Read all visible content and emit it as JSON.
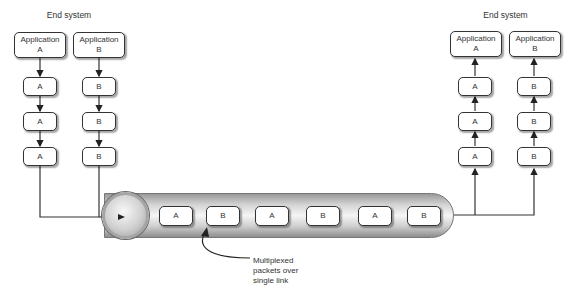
{
  "left_end_system": {
    "title": "End system",
    "applications": [
      {
        "label_line1": "Application",
        "label_line2": "A"
      },
      {
        "label_line1": "Application",
        "label_line2": "B"
      }
    ],
    "stack_a": [
      "A",
      "A",
      "A"
    ],
    "stack_b": [
      "B",
      "B",
      "B"
    ]
  },
  "right_end_system": {
    "title": "End system",
    "applications": [
      {
        "label_line1": "Application",
        "label_line2": "A"
      },
      {
        "label_line1": "Application",
        "label_line2": "B"
      }
    ],
    "stack_a": [
      "A",
      "A",
      "A"
    ],
    "stack_b": [
      "B",
      "B",
      "B"
    ]
  },
  "link": {
    "packets": [
      "A",
      "B",
      "A",
      "B",
      "A",
      "B"
    ],
    "annotation": [
      "Multiplexed",
      "packets over",
      "single link"
    ]
  }
}
